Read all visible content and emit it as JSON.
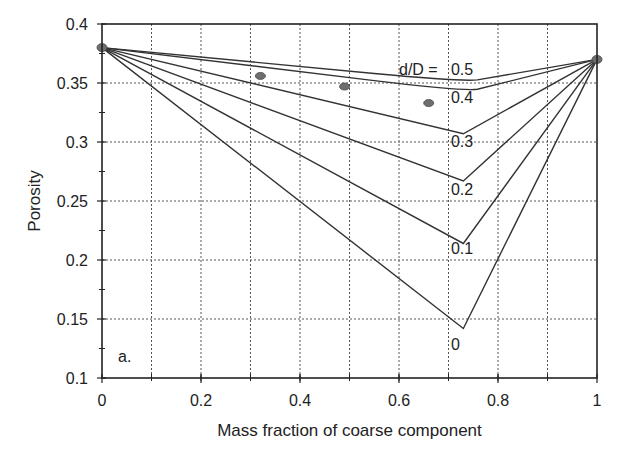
{
  "chart_data": {
    "type": "line",
    "title": "",
    "panel_label": "a.",
    "xlabel": "Mass fraction of coarse component",
    "ylabel": "Porosity",
    "xlim": [
      0,
      1
    ],
    "ylim": [
      0.1,
      0.4
    ],
    "x_ticks": [
      0,
      0.2,
      0.4,
      0.6,
      0.8,
      1
    ],
    "x_tick_labels": [
      "0",
      "0.2",
      "0.4",
      "0.6",
      "0.8",
      "1"
    ],
    "y_ticks": [
      0.1,
      0.15,
      0.2,
      0.25,
      0.3,
      0.35,
      0.4
    ],
    "y_tick_labels": [
      "0.1",
      "0.15",
      "0.2",
      "0.25",
      "0.3",
      "0.35",
      "0.4"
    ],
    "grid": true,
    "grid_style": "dashed",
    "x_grid": [
      0.1,
      0.2,
      0.3,
      0.4,
      0.5,
      0.6,
      0.7,
      0.8,
      0.9
    ],
    "y_grid": [
      0.15,
      0.2,
      0.25,
      0.3,
      0.35
    ],
    "legend_title": "d/D =",
    "series": [
      {
        "name": "0.5",
        "label": "d/D = 0.5",
        "x": [
          0,
          0.55,
          0.73,
          1
        ],
        "y": [
          0.38,
          0.358,
          0.351,
          0.37
        ],
        "smooth": true
      },
      {
        "name": "0.4",
        "label": "0.4",
        "x": [
          0,
          0.55,
          0.73,
          1
        ],
        "y": [
          0.38,
          0.352,
          0.343,
          0.37
        ],
        "smooth": true
      },
      {
        "name": "0.3",
        "label": "0.3",
        "x": [
          0,
          0.73,
          1
        ],
        "y": [
          0.38,
          0.307,
          0.37
        ]
      },
      {
        "name": "0.2",
        "label": "0.2",
        "x": [
          0,
          0.73,
          1
        ],
        "y": [
          0.38,
          0.267,
          0.37
        ]
      },
      {
        "name": "0.1",
        "label": "0.1",
        "x": [
          0,
          0.73,
          1
        ],
        "y": [
          0.38,
          0.214,
          0.37
        ]
      },
      {
        "name": "0",
        "label": "0",
        "x": [
          0,
          0.73,
          1
        ],
        "y": [
          0.38,
          0.142,
          0.37
        ]
      }
    ],
    "endpoints": [
      {
        "x": 0,
        "y": 0.38
      },
      {
        "x": 1,
        "y": 0.37
      }
    ],
    "measured_points": [
      {
        "x": 0.32,
        "y": 0.356
      },
      {
        "x": 0.49,
        "y": 0.347
      },
      {
        "x": 0.66,
        "y": 0.333
      }
    ],
    "curve_labels": [
      {
        "text": "d/D =",
        "x": 0.6,
        "y": 0.357
      },
      {
        "text": "0.5",
        "x": 0.705,
        "y": 0.357
      },
      {
        "text": "0.4",
        "x": 0.705,
        "y": 0.333
      },
      {
        "text": "0.3",
        "x": 0.705,
        "y": 0.296
      },
      {
        "text": "0.2",
        "x": 0.705,
        "y": 0.255
      },
      {
        "text": "0.1",
        "x": 0.705,
        "y": 0.205
      },
      {
        "text": "0",
        "x": 0.705,
        "y": 0.124
      }
    ],
    "colors": {
      "line": "#333333",
      "grid": "#555555",
      "marker": "#6e6e6e",
      "axis": "#222222"
    }
  }
}
